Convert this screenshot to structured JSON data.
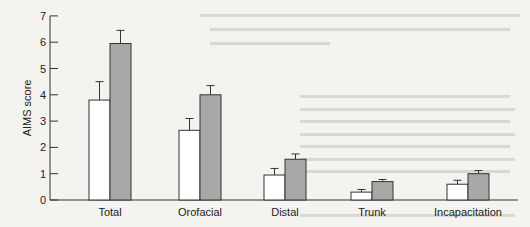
{
  "chart_data": {
    "type": "bar",
    "title": "",
    "xlabel": "",
    "ylabel": "AIMS score",
    "ylim": [
      0,
      7
    ],
    "yticks": [
      0,
      1,
      2,
      3,
      4,
      5,
      6,
      7
    ],
    "grid": false,
    "legend": null,
    "categories": [
      "Total",
      "Orofacial",
      "Distal",
      "Trunk",
      "Incapacitation"
    ],
    "series": [
      {
        "name": "Group 1 (white)",
        "color": "#ffffff",
        "values": [
          3.8,
          2.65,
          0.95,
          0.3,
          0.6
        ],
        "error": [
          0.7,
          0.45,
          0.25,
          0.1,
          0.15
        ]
      },
      {
        "name": "Group 2 (gray)",
        "color": "#a8a8a8",
        "values": [
          5.95,
          4.0,
          1.55,
          0.7,
          1.0
        ],
        "error": [
          0.5,
          0.35,
          0.2,
          0.08,
          0.12
        ]
      }
    ]
  },
  "axis": {
    "ylabel": "AIMS score",
    "ticks": [
      "0",
      "1",
      "2",
      "3",
      "4",
      "5",
      "6",
      "7"
    ]
  },
  "categories": [
    "Total",
    "Orofacial",
    "Distal",
    "Trunk",
    "Incapacitation"
  ]
}
